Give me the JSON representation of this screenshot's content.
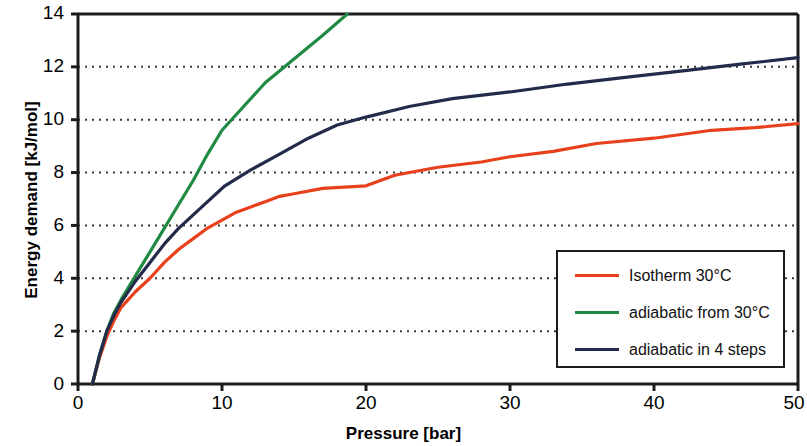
{
  "chart_data": {
    "type": "line",
    "title": "",
    "xlabel": "Pressure [bar]",
    "ylabel": "Energy demand [kJ/mol]",
    "xlim": [
      0,
      50
    ],
    "ylim": [
      0,
      14
    ],
    "xticks": [
      "0",
      "10",
      "20",
      "30",
      "40",
      "50"
    ],
    "xtick_values": [
      0,
      10,
      20,
      30,
      40,
      50
    ],
    "yticks": [
      "0",
      "2",
      "4",
      "6",
      "8",
      "10",
      "12",
      "14"
    ],
    "ytick_values": [
      0,
      2,
      4,
      6,
      8,
      10,
      12,
      14
    ],
    "grid": "horizontal-dotted",
    "legend_position": "lower-right",
    "series": [
      {
        "name": "Isotherm 30°C",
        "color": "#E8401C",
        "points": [
          [
            1.0,
            0.0
          ],
          [
            1.5,
            1.0
          ],
          [
            2.0,
            1.8
          ],
          [
            2.5,
            2.4
          ],
          [
            3.0,
            2.9
          ],
          [
            4.0,
            3.5
          ],
          [
            5.0,
            4.0
          ],
          [
            6.0,
            4.6
          ],
          [
            7.0,
            5.1
          ],
          [
            8.0,
            5.5
          ],
          [
            9.0,
            5.9
          ],
          [
            10.0,
            6.2
          ],
          [
            11.0,
            6.5
          ],
          [
            12.0,
            6.7
          ],
          [
            13.0,
            6.9
          ],
          [
            14.0,
            7.1
          ],
          [
            15.0,
            7.2
          ],
          [
            17.0,
            7.4
          ],
          [
            20.0,
            7.5
          ],
          [
            22.0,
            7.9
          ],
          [
            25.0,
            8.2
          ],
          [
            28.0,
            8.4
          ],
          [
            30.0,
            8.6
          ],
          [
            33.0,
            8.8
          ],
          [
            36.0,
            9.1
          ],
          [
            40.0,
            9.3
          ],
          [
            44.0,
            9.6
          ],
          [
            47.0,
            9.7
          ],
          [
            50.0,
            9.85
          ]
        ]
      },
      {
        "name": "adiabatic from 30°C",
        "color": "#218A42",
        "points": [
          [
            1.0,
            0.0
          ],
          [
            1.5,
            1.1
          ],
          [
            2.0,
            2.0
          ],
          [
            2.5,
            2.7
          ],
          [
            3.0,
            3.2
          ],
          [
            4.0,
            4.1
          ],
          [
            5.0,
            5.0
          ],
          [
            6.0,
            5.9
          ],
          [
            7.0,
            6.8
          ],
          [
            8.0,
            7.7
          ],
          [
            9.0,
            8.7
          ],
          [
            10.0,
            9.6
          ],
          [
            11.5,
            10.5
          ],
          [
            13.0,
            11.4
          ],
          [
            15.0,
            12.3
          ],
          [
            17.0,
            13.2
          ],
          [
            18.7,
            14.0
          ]
        ]
      },
      {
        "name": "adiabatic in 4 steps",
        "color": "#232B4A",
        "points": [
          [
            1.0,
            0.0
          ],
          [
            1.5,
            1.1
          ],
          [
            2.0,
            2.0
          ],
          [
            2.5,
            2.6
          ],
          [
            3.0,
            3.1
          ],
          [
            4.0,
            3.9
          ],
          [
            5.0,
            4.6
          ],
          [
            6.0,
            5.3
          ],
          [
            7.0,
            5.9
          ],
          [
            8.0,
            6.4
          ],
          [
            9.0,
            6.9
          ],
          [
            10.2,
            7.5
          ],
          [
            12.0,
            8.1
          ],
          [
            14.0,
            8.7
          ],
          [
            16.0,
            9.3
          ],
          [
            18.0,
            9.8
          ],
          [
            20.0,
            10.1
          ],
          [
            23.0,
            10.5
          ],
          [
            26.0,
            10.8
          ],
          [
            30.0,
            11.05
          ],
          [
            34.0,
            11.35
          ],
          [
            38.0,
            11.6
          ],
          [
            42.0,
            11.85
          ],
          [
            46.0,
            12.1
          ],
          [
            50.0,
            12.35
          ]
        ]
      }
    ]
  },
  "legend": {
    "entries": [
      {
        "label": "Isotherm 30°C",
        "color": "#E8401C"
      },
      {
        "label": "adiabatic from 30°C",
        "color": "#218A42"
      },
      {
        "label": "adiabatic in 4 steps",
        "color": "#232B4A"
      }
    ]
  },
  "axes": {
    "y_title": "Energy demand [kJ/mol]",
    "x_title": "Pressure [bar]",
    "y_labels": [
      "14",
      "12",
      "10",
      "8",
      "6",
      "4",
      "2",
      "0"
    ],
    "x_labels": [
      "0",
      "10",
      "20",
      "30",
      "40",
      "50"
    ]
  },
  "colors": {
    "axis": "#1c1c1c",
    "grid": "#3a3a3a",
    "background": "#ffffff"
  }
}
